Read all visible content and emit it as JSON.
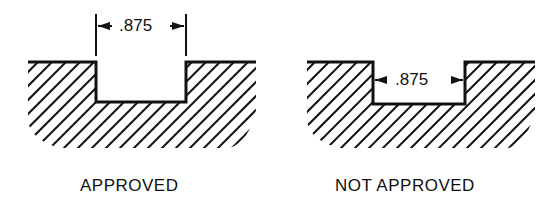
{
  "figures": [
    {
      "id": "approved",
      "caption": "APPROVED",
      "dimension_label": ".875",
      "dimension_position": "above-opening",
      "stroke_color": "#111111"
    },
    {
      "id": "not-approved",
      "caption": "NOT APPROVED",
      "dimension_label": ".875",
      "dimension_position": "inside-slot",
      "stroke_color": "#111111"
    }
  ]
}
